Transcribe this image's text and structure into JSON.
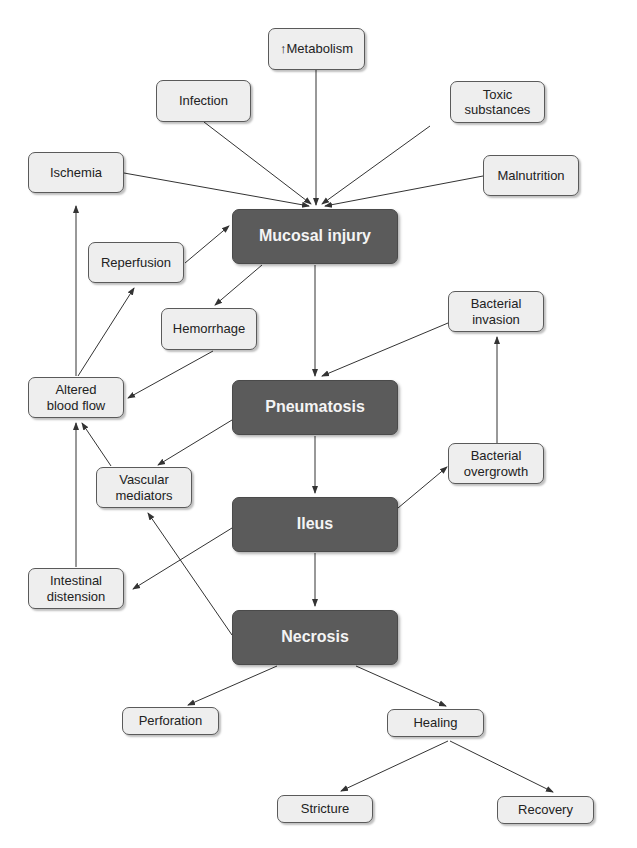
{
  "diagram": {
    "colors": {
      "primary_fill": "#5b5b5b",
      "primary_text": "#f4f4f4",
      "secondary_fill": "#eeeeee",
      "secondary_text": "#222222",
      "edge": "#333333"
    },
    "nodes": {
      "metabolism": {
        "label": "↑Metabolism",
        "type": "secondary"
      },
      "infection": {
        "label": "Infection",
        "type": "secondary"
      },
      "toxic": {
        "label": "Toxic\nsubstances",
        "type": "secondary"
      },
      "ischemia": {
        "label": "Ischemia",
        "type": "secondary"
      },
      "malnutrition": {
        "label": "Malnutrition",
        "type": "secondary"
      },
      "mucosal_injury": {
        "label": "Mucosal injury",
        "type": "primary"
      },
      "reperfusion": {
        "label": "Reperfusion",
        "type": "secondary"
      },
      "hemorrhage": {
        "label": "Hemorrhage",
        "type": "secondary"
      },
      "bacterial_invasion": {
        "label": "Bacterial\ninvasion",
        "type": "secondary"
      },
      "altered_blood_flow": {
        "label": "Altered\nblood flow",
        "type": "secondary"
      },
      "pneumatosis": {
        "label": "Pneumatosis",
        "type": "primary"
      },
      "vascular_mediators": {
        "label": "Vascular\nmediators",
        "type": "secondary"
      },
      "bacterial_overgrowth": {
        "label": "Bacterial\novergrowth",
        "type": "secondary"
      },
      "ileus": {
        "label": "Ileus",
        "type": "primary"
      },
      "intestinal_distension": {
        "label": "Intestinal\ndistension",
        "type": "secondary"
      },
      "necrosis": {
        "label": "Necrosis",
        "type": "primary"
      },
      "perforation": {
        "label": "Perforation",
        "type": "secondary"
      },
      "healing": {
        "label": "Healing",
        "type": "secondary"
      },
      "stricture": {
        "label": "Stricture",
        "type": "secondary"
      },
      "recovery": {
        "label": "Recovery",
        "type": "secondary"
      }
    },
    "edges": [
      {
        "from": "metabolism",
        "to": "mucosal_injury"
      },
      {
        "from": "infection",
        "to": "mucosal_injury"
      },
      {
        "from": "toxic",
        "to": "mucosal_injury"
      },
      {
        "from": "ischemia",
        "to": "mucosal_injury"
      },
      {
        "from": "malnutrition",
        "to": "mucosal_injury"
      },
      {
        "from": "reperfusion",
        "to": "mucosal_injury"
      },
      {
        "from": "mucosal_injury",
        "to": "hemorrhage"
      },
      {
        "from": "mucosal_injury",
        "to": "pneumatosis"
      },
      {
        "from": "hemorrhage",
        "to": "altered_blood_flow"
      },
      {
        "from": "altered_blood_flow",
        "to": "ischemia"
      },
      {
        "from": "altered_blood_flow",
        "to": "reperfusion"
      },
      {
        "from": "bacterial_invasion",
        "to": "pneumatosis"
      },
      {
        "from": "pneumatosis",
        "to": "vascular_mediators"
      },
      {
        "from": "pneumatosis",
        "to": "ileus"
      },
      {
        "from": "vascular_mediators",
        "to": "altered_blood_flow"
      },
      {
        "from": "ileus",
        "to": "bacterial_overgrowth"
      },
      {
        "from": "bacterial_overgrowth",
        "to": "bacterial_invasion"
      },
      {
        "from": "ileus",
        "to": "intestinal_distension"
      },
      {
        "from": "intestinal_distension",
        "to": "altered_blood_flow"
      },
      {
        "from": "ileus",
        "to": "necrosis"
      },
      {
        "from": "necrosis",
        "to": "vascular_mediators"
      },
      {
        "from": "necrosis",
        "to": "perforation"
      },
      {
        "from": "necrosis",
        "to": "healing"
      },
      {
        "from": "healing",
        "to": "stricture"
      },
      {
        "from": "healing",
        "to": "recovery"
      }
    ]
  }
}
